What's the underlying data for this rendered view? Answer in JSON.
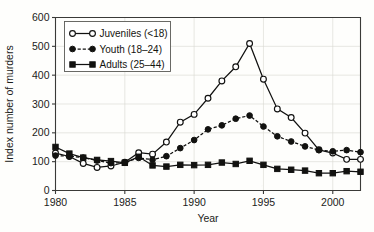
{
  "chart_data": {
    "type": "line",
    "title": "",
    "xlabel": "Year",
    "ylabel": "Index number of murders",
    "xlim": [
      1980,
      2002
    ],
    "ylim": [
      0,
      600
    ],
    "ytick_values": [
      0,
      100,
      200,
      300,
      400,
      500,
      600
    ],
    "ytick_labels": [
      "0",
      "100",
      "200",
      "300",
      "400",
      "500",
      "600"
    ],
    "xtick_values": [
      1980,
      1985,
      1990,
      1995,
      2000
    ],
    "xtick_labels": [
      "1980",
      "1985",
      "1990",
      "1995",
      "2000"
    ],
    "grid": true,
    "legend_position": "upper-left",
    "x": [
      1980,
      1981,
      1982,
      1983,
      1984,
      1985,
      1986,
      1987,
      1988,
      1989,
      1990,
      1991,
      1992,
      1993,
      1994,
      1995,
      1996,
      1997,
      1998,
      1999,
      2000,
      2001,
      2002
    ],
    "series": [
      {
        "name": "Juveniles (<18)",
        "marker": "open-circle",
        "linestyle": "solid",
        "color": "#111110",
        "values": [
          130,
          118,
          94,
          80,
          85,
          98,
          131,
          126,
          168,
          237,
          264,
          320,
          380,
          429,
          510,
          386,
          283,
          253,
          199,
          141,
          130,
          108,
          108
        ]
      },
      {
        "name": "Youth (18–24)",
        "marker": "filled-circle",
        "linestyle": "dashed",
        "color": "#121210",
        "values": [
          121,
          119,
          114,
          104,
          95,
          97,
          113,
          107,
          119,
          147,
          175,
          212,
          226,
          249,
          260,
          222,
          188,
          170,
          153,
          140,
          136,
          140,
          133
        ]
      },
      {
        "name": "Adults (25–44)",
        "marker": "filled-square",
        "linestyle": "solid",
        "color": "#121210",
        "values": [
          151,
          128,
          114,
          106,
          102,
          96,
          117,
          87,
          83,
          89,
          88,
          89,
          97,
          92,
          103,
          89,
          75,
          72,
          69,
          60,
          60,
          67,
          65
        ]
      }
    ]
  }
}
